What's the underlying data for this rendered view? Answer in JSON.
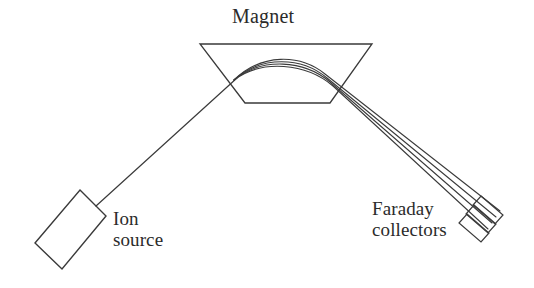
{
  "figure": {
    "kind": "schematic-diagram",
    "background_color": "#ffffff",
    "ink_color": "#3a3a3a",
    "text_color": "#2b2b2b"
  },
  "labels": {
    "magnet": "Magnet",
    "ion_source_line1": "Ion",
    "ion_source_line2": "source",
    "faraday_line1": "Faraday",
    "faraday_line2": "collectors"
  },
  "components": {
    "magnet": {
      "name": "Magnet",
      "shape": "trapezoid",
      "points": "200,44 372,44 330,103 245,103",
      "stroke": "#3a3a3a",
      "stroke_width": 1.3
    },
    "ion_source": {
      "name": "Ion source",
      "shape": "rotated-rectangle",
      "points": "80,190 106,216 62,269 35,243",
      "stroke": "#3a3a3a",
      "stroke_width": 1.4
    },
    "incident_beam": {
      "name": "incident ion beam",
      "path": "M 96,206 L 237,78",
      "stroke": "#3a3a3a",
      "stroke_width": 1.2
    },
    "deflected_beams": [
      {
        "id": "beam-1",
        "path": "M 234,80 C 262,53 300,54 325,74 L 500,211",
        "stroke_width": 1.1
      },
      {
        "id": "beam-2",
        "path": "M 234,80 C 262,55 302,57 327,78 L 496,217",
        "stroke_width": 1.1
      },
      {
        "id": "beam-3",
        "path": "M 234,80 C 262,57 304,60 330,82 L 492,223",
        "stroke_width": 1.1
      },
      {
        "id": "beam-4",
        "path": "M 234,80 C 262,59 306,63 333,86 L 488,229",
        "stroke_width": 1.1
      }
    ],
    "faraday_collectors": [
      {
        "id": "collector-1",
        "points": "481,196 503,215 495,224 473,205",
        "stroke_width": 1.2
      },
      {
        "id": "collector-2",
        "points": "474,205 496,224 488,233 466,214",
        "stroke_width": 1.2
      },
      {
        "id": "collector-3",
        "points": "467,214 489,233 481,242 459,223",
        "stroke_width": 1.2
      }
    ]
  }
}
